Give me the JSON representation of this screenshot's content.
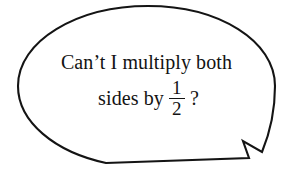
{
  "canvas": {
    "width": 293,
    "height": 174,
    "background_color": "#ffffff"
  },
  "speech_bubble": {
    "shape": "ellipse-with-zigzag-tail",
    "tail_position": "bottom-right",
    "outline_color": "#141414",
    "fill_color": "#ffffff",
    "stroke_width": 2.1,
    "path": "M 148 6 C 77 6 18 41 18 86 C 18 122 55 152 106 163 L 249 158 L 243 141 L 262 152 C 269 135 275 110 275 86 C 275 41 219 6 148 6 Z"
  },
  "message": {
    "line_1": "Can’t I multiply both",
    "line_2": {
      "before_fraction": "sides by",
      "fraction": {
        "numerator": "1",
        "denominator": "2"
      },
      "after_fraction": "?"
    },
    "full_text": "Can’t I multiply both sides by 1/2 ?",
    "text_color": "#131313"
  }
}
